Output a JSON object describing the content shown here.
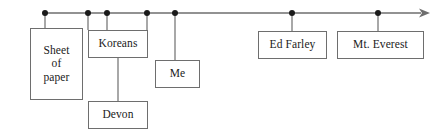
{
  "diagram": {
    "type": "timeline",
    "orientation": "horizontal-left-to-right",
    "axis": {
      "name": "timeline-axis",
      "start_x": 45,
      "end_x": 430,
      "y": 13,
      "has_arrowhead": true,
      "arrow_direction": "right",
      "stroke_color": "#6e6e6e",
      "stroke_width": 1.4
    },
    "marker_color": "#1a1a1a",
    "marker_radius": 3,
    "markers": [
      {
        "name": "marker-sheet-of-paper",
        "x": 45,
        "y": 13,
        "connects_to": "sheet-of-paper"
      },
      {
        "name": "marker-koreans-left",
        "x": 88,
        "y": 13,
        "connects_to": "koreans"
      },
      {
        "name": "marker-koreans-mid",
        "x": 107,
        "y": 13,
        "connects_to": "koreans"
      },
      {
        "name": "marker-koreans-right",
        "x": 147,
        "y": 13,
        "connects_to": "koreans"
      },
      {
        "name": "marker-me",
        "x": 175,
        "y": 13,
        "connects_to": "me"
      },
      {
        "name": "marker-ed-farley",
        "x": 292,
        "y": 13,
        "connects_to": "ed-farley"
      },
      {
        "name": "marker-mt-everest",
        "x": 378,
        "y": 13,
        "connects_to": "mt-everest"
      }
    ],
    "nodes": [
      {
        "id": "sheet-of-paper",
        "label": "Sheet\nof\npaper",
        "x": 30,
        "y": 28,
        "width": 53,
        "height": 72,
        "connector_x": 45,
        "connector_from_y": 13,
        "connector_to_y": 28
      },
      {
        "id": "koreans",
        "label": "Koreans",
        "x": 88,
        "y": 30,
        "width": 60,
        "height": 28,
        "connector_x": 107,
        "connector_from_y": 13,
        "connector_to_y": 30
      },
      {
        "id": "devon",
        "label": "Devon",
        "x": 88,
        "y": 101,
        "width": 60,
        "height": 28,
        "connector_x": 118,
        "connector_from_y": 58,
        "connector_to_y": 101
      },
      {
        "id": "me",
        "label": "Me",
        "x": 155,
        "y": 60,
        "width": 45,
        "height": 28,
        "connector_x": 175,
        "connector_from_y": 13,
        "connector_to_y": 60
      },
      {
        "id": "ed-farley",
        "label": "Ed Farley",
        "x": 258,
        "y": 31,
        "width": 69,
        "height": 28,
        "connector_x": 292,
        "connector_from_y": 13,
        "connector_to_y": 31
      },
      {
        "id": "mt-everest",
        "label": "Mt. Everest",
        "x": 337,
        "y": 31,
        "width": 87,
        "height": 28,
        "connector_x": 378,
        "connector_from_y": 13,
        "connector_to_y": 31
      }
    ],
    "extra_connectors": [
      {
        "name": "connector-koreans-left-edge",
        "x": 88,
        "from_y": 13,
        "to_y": 30
      },
      {
        "name": "connector-koreans-right-edge",
        "x": 147,
        "from_y": 13,
        "to_y": 30
      }
    ],
    "colors": {
      "background": "#ffffff",
      "stroke": "#6e6e6e",
      "text": "#1a1a1a",
      "marker": "#1a1a1a"
    }
  }
}
